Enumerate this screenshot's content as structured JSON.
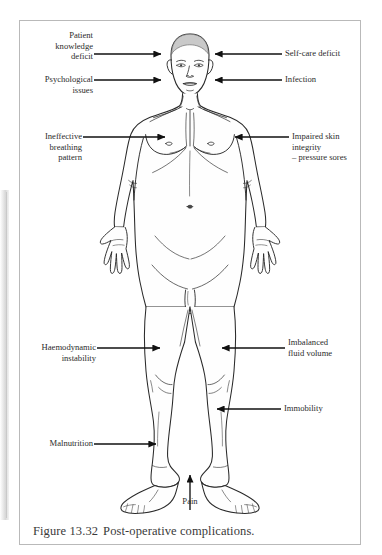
{
  "figure": {
    "caption_number": "Figure 13.32",
    "caption_text": "Post-operative complications."
  },
  "annotations": {
    "left": [
      {
        "id": "patient-knowledge-deficit",
        "text": "Patient\nknowledge\ndeficit",
        "arrow_direction": "right",
        "target": "head"
      },
      {
        "id": "psychological-issues",
        "text": "Psychological\nissues",
        "arrow_direction": "right",
        "target": "face"
      },
      {
        "id": "ineffective-breathing-pattern",
        "text": "Ineffective\nbreathing\npattern",
        "arrow_direction": "right",
        "target": "chest"
      },
      {
        "id": "haemodynamic-instability",
        "text": "Haemodynamic\ninstability",
        "arrow_direction": "right",
        "target": "thigh"
      },
      {
        "id": "malnutrition",
        "text": "Malnutrition",
        "arrow_direction": "right",
        "target": "lower-leg"
      }
    ],
    "right": [
      {
        "id": "self-care-deficit",
        "text": "Self-care deficit",
        "arrow_direction": "left",
        "target": "head"
      },
      {
        "id": "infection",
        "text": "Infection",
        "arrow_direction": "left",
        "target": "face"
      },
      {
        "id": "impaired-skin-integrity",
        "text": "Impaired skin\nintegrity\n– pressure sores",
        "arrow_direction": "left",
        "target": "shoulder"
      },
      {
        "id": "imbalanced-fluid-volume",
        "text": "Imbalanced\nfluid volume",
        "arrow_direction": "left",
        "target": "thigh"
      },
      {
        "id": "immobility",
        "text": "Immobility",
        "arrow_direction": "left",
        "target": "lower-leg"
      }
    ],
    "bottom": [
      {
        "id": "pain",
        "text": "Pain",
        "arrow_direction": "up",
        "target": "feet"
      }
    ]
  },
  "colors": {
    "line": "#1d1d1d",
    "body_outline": "#2a2a2a",
    "body_fill": "#fefefe",
    "hair_fill": "#c9c9c9",
    "text": "#2b2b2b",
    "caption_text": "#3a3a3a",
    "box_border": "#b9b9b9",
    "page_background": "#ffffff"
  }
}
